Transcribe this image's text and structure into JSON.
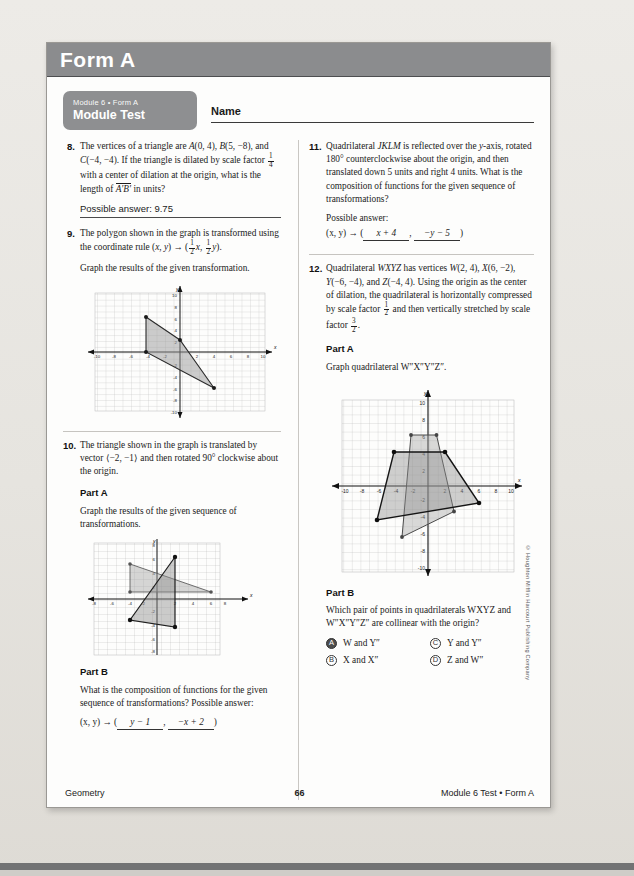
{
  "header": {
    "form_title": "Form A"
  },
  "badge": {
    "sup": "Module 6 • Form A",
    "title": "Module Test"
  },
  "name_field": {
    "label": "Name",
    "value": ""
  },
  "questions": {
    "q8": {
      "number": "8.",
      "line1_a": "The vertices of a triangle are ",
      "A": "A",
      "A_coord": "(0, 4), ",
      "B": "B",
      "B_coord": "(5, −8),",
      "line2_a": "and ",
      "C": "C",
      "C_coord": "(−4, −4). If the triangle is dilated by scale",
      "line3_a": "factor ",
      "frac_n": "1",
      "frac_d": "4",
      "line3_b": " with a center of dilation at the origin,",
      "line4_a": "what is the length of ",
      "seg": "A′B′",
      "line4_b": " in units?",
      "answer": "Possible answer: 9.75"
    },
    "q9": {
      "number": "9.",
      "line1": "The polygon shown in the graph is transformed",
      "line2_a": "using the coordinate rule (",
      "x": "x",
      "comma": ", ",
      "y": "y",
      "line2_b": ") → (",
      "fx_n": "1",
      "fx_d": "2",
      "fx_var": "x",
      "fy_n": "1",
      "fy_d": "2",
      "fy_var": "y",
      "line2_c": ").",
      "line3": "Graph the results of the given transformation."
    },
    "q10": {
      "number": "10.",
      "line1": "The triangle shown in the graph is translated by",
      "line2": "vector ⟨−2, −1⟩ and then rotated 90° clockwise",
      "line3": "about the origin.",
      "partA_label": "Part A",
      "partA_text1": "Graph the results of the given sequence of",
      "partA_text2": "transformations.",
      "partB_label": "Part B",
      "partB_text1": "What is the composition of functions for the given",
      "partB_text2": "sequence of transformations?  Possible answer:",
      "rule_prefix": "(x, y) → (",
      "rule_blank1": "y − 1",
      "rule_sep": ", ",
      "rule_blank2": "−x + 2",
      "rule_suffix": ")"
    },
    "q11": {
      "number": "11.",
      "line1_a": "Quadrilateral ",
      "JKLM": "JKLM",
      "line1_b": " is reflected over the ",
      "yaxis": "y",
      "line1_c": "-axis,",
      "line2": "rotated 180° counterclockwise about the origin,",
      "line3": "and then translated down 5 units and right 4",
      "line4": "units. What is the composition of functions for",
      "line5": "the given sequence of transformations?",
      "line6": "Possible answer:",
      "rule_prefix": "(x, y) → (",
      "rule_blank1": "x + 4",
      "rule_sep": ", ",
      "rule_blank2": "−y − 5",
      "rule_suffix": ")"
    },
    "q12": {
      "number": "12.",
      "line1_a": "Quadrilateral ",
      "WXYZ": "WXYZ",
      "line1_b": " has vertices ",
      "W": "W",
      "W_coord": "(2, 4),",
      "line2_X": "X",
      "line2_Xc": "(6, −2), ",
      "line2_Y": "Y",
      "line2_Yc": "(−6, −4), and ",
      "line2_Z": "Z",
      "line2_Zc": "(−4, 4). Using the",
      "line3": "origin as the center of dilation, the quadrilateral",
      "line4_a": "is horizontally compressed by scale factor ",
      "f1n": "1",
      "f1d": "2",
      "line5_a": "and then vertically stretched by scale factor ",
      "f2n": "3",
      "f2d": "2",
      "line5_b": ".",
      "partA_label": "Part A",
      "partA_text": "Graph quadrilateral W″X″Y″Z″.",
      "partB_label": "Part B",
      "partB_text1": "Which pair of points in quadrilaterals WXYZ and",
      "partB_text2": "W″X″Y″Z″ are collinear with the origin?",
      "choices": [
        {
          "letter": "A",
          "text": "W and Y″",
          "selected": true
        },
        {
          "letter": "C",
          "text": "Y and Y″",
          "selected": false
        },
        {
          "letter": "B",
          "text": "X and X″",
          "selected": false
        },
        {
          "letter": "D",
          "text": "Z and W″",
          "selected": false
        }
      ]
    }
  },
  "graphs": {
    "g9": {
      "axis_label_x": "x",
      "axis_label_y": "y",
      "xmin": -10,
      "xmax": 10,
      "ymin": -10,
      "ymax": 10,
      "ticks": [
        "-10",
        "-8",
        "-6",
        "-4",
        "-2",
        "2",
        "4",
        "6",
        "8",
        "10"
      ],
      "polygon": [
        [
          -4,
          6
        ],
        [
          0,
          2
        ],
        [
          4,
          -6
        ],
        [
          -4,
          0
        ]
      ]
    },
    "g10": {
      "axis_label_x": "x",
      "axis_label_y": "y",
      "xmin": -8,
      "xmax": 8,
      "ymin": -8,
      "ymax": 8,
      "xticks": [
        "-8",
        "-6",
        "-4",
        "-2",
        "2",
        "4",
        "6",
        "8"
      ],
      "yticks": [
        "8",
        "6",
        "4",
        "2",
        "-2",
        "-4",
        "-6",
        "-8"
      ],
      "triangle_original": [
        [
          -4,
          5
        ],
        [
          -4,
          1
        ],
        [
          5,
          1
        ]
      ],
      "triangle_image": [
        [
          2,
          6
        ],
        [
          -3,
          -2
        ],
        [
          2,
          -3
        ]
      ]
    },
    "g12": {
      "axis_label_x": "x",
      "axis_label_y": "y",
      "xmin": -10,
      "xmax": 10,
      "ymin": -10,
      "ymax": 10,
      "ticks": [
        "-10",
        "-8",
        "-6",
        "-4",
        "-2",
        "2",
        "4",
        "6",
        "8",
        "10"
      ],
      "quad_original": [
        [
          2,
          4
        ],
        [
          6,
          -2
        ],
        [
          -6,
          -4
        ],
        [
          -4,
          4
        ]
      ],
      "quad_image": [
        [
          1,
          6
        ],
        [
          3,
          -3
        ],
        [
          -3,
          -6
        ],
        [
          -2,
          6
        ]
      ]
    }
  },
  "footer": {
    "left": "Geometry",
    "page": "66",
    "right": "Module 6 Test • Form A"
  },
  "copyright": "© Houghton Mifflin Harcourt Publishing Company",
  "colors": {
    "header_bar": "#8b8c8e",
    "badge": "#8e8f91",
    "paper": "#fdfdfc",
    "shape_fill": "#9a9a9a"
  }
}
